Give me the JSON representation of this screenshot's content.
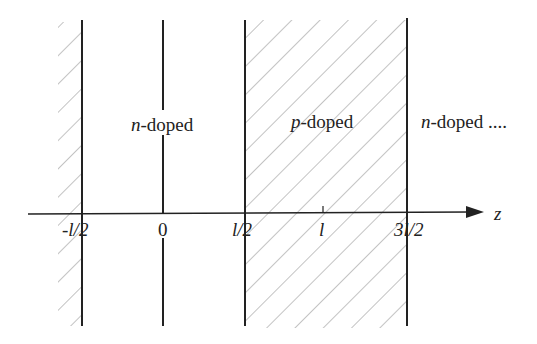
{
  "diagram": {
    "regions": [
      {
        "label_italic": "n",
        "label_rest": "-doped",
        "hatched": false,
        "position": "between -l/2 and l/2"
      },
      {
        "label_italic": "p",
        "label_rest": "-doped",
        "hatched": true,
        "position": "between l/2 and 3l/2"
      },
      {
        "label_italic": "n",
        "label_rest": "-doped ....",
        "hatched": false,
        "position": "beyond 3l/2"
      }
    ],
    "axis": {
      "label": "z",
      "ticks": [
        "-l/2",
        "0",
        "l/2",
        "l",
        "3l/2"
      ]
    },
    "colors": {
      "line": "#222222",
      "hatch": "#9a9a9a",
      "background": "#ffffff"
    }
  }
}
